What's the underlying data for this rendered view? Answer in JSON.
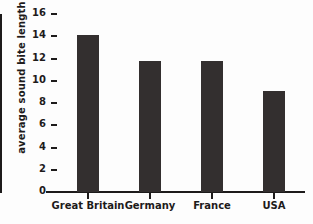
{
  "chart_data": {
    "type": "bar",
    "title": "",
    "xlabel": "",
    "ylabel": "average sound bite length",
    "categories": [
      "Great Britain",
      "Germany",
      "France",
      "USA"
    ],
    "values": [
      14.1,
      11.8,
      11.8,
      9.1
    ],
    "ylim": [
      0,
      16
    ],
    "ytick_labels": [
      "0",
      "2",
      "4",
      "6",
      "8",
      "10",
      "12",
      "14",
      "16"
    ],
    "ytick_values": [
      0,
      2,
      4,
      6,
      8,
      10,
      12,
      14,
      16
    ],
    "grid": false,
    "legend": false,
    "bar_color": "#332f2f",
    "axis_color": "#1d1b1b",
    "background_color": "#fdfdfd"
  }
}
